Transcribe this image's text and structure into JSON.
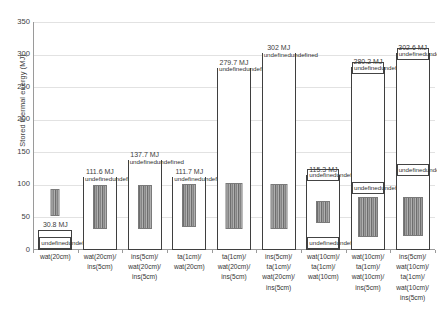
{
  "chart_data": {
    "type": "bar",
    "title": "",
    "xlabel": "",
    "ylabel": "Stored thermal energy (MJ)",
    "ylim": [
      0,
      350
    ],
    "yticks": [
      0,
      50,
      100,
      150,
      200,
      250,
      300,
      350
    ],
    "grid": true,
    "legend": "none",
    "unit": "MJ",
    "categories": [
      "wat(20cm)",
      "wat(20cm)/\nins(5cm)",
      "ins(5cm)/\nwat(20cm)/\nins(5cm)",
      "ta(1cm)/\nwat(20cm)",
      "ta(1cm)/\nwat(20cm)/\nins(5cm)",
      "ins(5cm)/\nta(1cm)/\nwat(20cm)/\nins(5cm)",
      "wat(10cm)/\nta(1cm)/\nwat(10cm)",
      "wat(10cm)/\nta(1cm)/\nwat(10cm)/\nins(5cm)",
      "ins(5cm)/\nwat(10cm)/\nta(1cm)/\nwat(10cm)/\nins(5cm)"
    ],
    "values": [
      30.8,
      111.6,
      137.7,
      111.7,
      279.7,
      302.0,
      115.3,
      280.2,
      302.6
    ],
    "value_labels": [
      "30.8 MJ",
      "111.6 MJ",
      "137.7 MJ",
      "111.7 MJ",
      "279.7 MJ",
      "302 MJ",
      "115.3 MJ",
      "280.2 MJ",
      "302.6 MJ"
    ],
    "annotations": [
      {
        "bar": 1,
        "zones": [
          {
            "name": "",
            "tw": "Tᵥᵥ=29.6 °C",
            "dt": "ΔT=3.1 °C"
          }
        ]
      },
      {
        "bar": 2,
        "zones": [
          {
            "name": "",
            "tw": "Tᵥᵥ=37.7 °C",
            "dt": "ΔT=11.2 °C"
          }
        ]
      },
      {
        "bar": 3,
        "zones": [
          {
            "name": "",
            "tw": "Tᵥᵥ=40.3 °C",
            "dt": "ΔT=13.8 °C"
          }
        ]
      },
      {
        "bar": 4,
        "zones": [
          {
            "name": "",
            "tw": "Tᵥᵥ=37.7 °C",
            "dt": "ΔT=11.2 °C"
          }
        ]
      },
      {
        "bar": 5,
        "zones": [
          {
            "name": "",
            "tw": "Tᵥᵥ=54.6 °C",
            "dt": "ΔT=28.1 °C"
          }
        ]
      },
      {
        "bar": 6,
        "zones": [
          {
            "name": "",
            "tw": "Tᵥᵥ=56.8 °C",
            "dt": "ΔT=30.3 °C"
          }
        ]
      },
      {
        "bar": 7,
        "zones": [
          {
            "name": "Outer",
            "tw": "Tᵥᵥ=43.3 °C",
            "dt": "ΔT=16.7 °C"
          },
          {
            "name": "Inner",
            "tw": "Tᵥᵥ=32.9 °C",
            "dt": "ΔT=6.4 °C"
          }
        ]
      },
      {
        "bar": 8,
        "zones": [
          {
            "name": "Outer",
            "tw": "Tᵥᵥ=55.4 °C",
            "dt": "ΔT=28.8 °C"
          },
          {
            "name": "Inner",
            "tw": "Tᵥᵥ=53.9 °C",
            "dt": "ΔT=27.4 °C"
          }
        ]
      },
      {
        "bar": 9,
        "zones": [
          {
            "name": "Outer",
            "tw": "Tᵥᵥ=57.7 °C",
            "dt": "ΔT=31.2 °C"
          },
          {
            "name": "Inner",
            "tw": "Tᵥᵥ=56.1 °C",
            "dt": "ΔT=29.6 °C"
          }
        ]
      }
    ]
  },
  "axis": {
    "ylabel": "Stored thermal energy (MJ)",
    "ytick_labels": [
      "0",
      "50",
      "100",
      "150",
      "200",
      "250",
      "300",
      "350"
    ]
  },
  "bars": [
    {
      "value_label": "30.8 MJ",
      "zone_a_name": "",
      "zone_a_tw": "T",
      "zone_a_twsub": "w",
      "zone_a_tweq": "=29.6 °C",
      "zone_a_dt": "ΔT=3.1 °C",
      "zone_b_name": "",
      "zone_b_tw": "",
      "zone_b_twsub": "",
      "zone_b_tweq": "",
      "zone_b_dt": ""
    },
    {
      "value_label": "111.6 MJ",
      "zone_a_name": "",
      "zone_a_tw": "T",
      "zone_a_twsub": "w",
      "zone_a_tweq": "=37.7 °C",
      "zone_a_dt": "ΔT=11.2 °C",
      "zone_b_name": "",
      "zone_b_tw": "",
      "zone_b_twsub": "",
      "zone_b_tweq": "",
      "zone_b_dt": ""
    },
    {
      "value_label": "137.7 MJ",
      "zone_a_name": "",
      "zone_a_tw": "T",
      "zone_a_twsub": "w",
      "zone_a_tweq": "=40.3 °C",
      "zone_a_dt": "ΔT=13.8 °C",
      "zone_b_name": "",
      "zone_b_tw": "",
      "zone_b_twsub": "",
      "zone_b_tweq": "",
      "zone_b_dt": ""
    },
    {
      "value_label": "111.7 MJ",
      "zone_a_name": "",
      "zone_a_tw": "T",
      "zone_a_twsub": "w",
      "zone_a_tweq": "=37.7 °C",
      "zone_a_dt": "ΔT=11.2 °C",
      "zone_b_name": "",
      "zone_b_tw": "",
      "zone_b_twsub": "",
      "zone_b_tweq": "",
      "zone_b_dt": ""
    },
    {
      "value_label": "279.7 MJ",
      "zone_a_name": "",
      "zone_a_tw": "T",
      "zone_a_twsub": "w",
      "zone_a_tweq": "=54.6 °C",
      "zone_a_dt": "ΔT=28.1 °C",
      "zone_b_name": "",
      "zone_b_tw": "",
      "zone_b_twsub": "",
      "zone_b_tweq": "",
      "zone_b_dt": ""
    },
    {
      "value_label": "302 MJ",
      "zone_a_name": "",
      "zone_a_tw": "T",
      "zone_a_twsub": "w",
      "zone_a_tweq": "=56.8 °C",
      "zone_a_dt": "ΔT=30.3 °C",
      "zone_b_name": "",
      "zone_b_tw": "",
      "zone_b_twsub": "",
      "zone_b_tweq": "",
      "zone_b_dt": ""
    },
    {
      "value_label": "115.3 MJ",
      "zone_a_name": "Outer",
      "zone_a_tw": "T",
      "zone_a_twsub": "w",
      "zone_a_tweq": "=43.3 °C",
      "zone_a_dt": "ΔT=16.7 °C",
      "zone_b_name": "Inner",
      "zone_b_tw": "T",
      "zone_b_twsub": "w",
      "zone_b_tweq": "=32.9 °C",
      "zone_b_dt": "ΔT=6.4 °C"
    },
    {
      "value_label": "280.2 MJ",
      "zone_a_name": "Outer",
      "zone_a_tw": "T",
      "zone_a_twsub": "w",
      "zone_a_tweq": "=55.4 °C",
      "zone_a_dt": "ΔT=28.8 °C",
      "zone_b_name": "Inner",
      "zone_b_tw": "T",
      "zone_b_twsub": "w",
      "zone_b_tweq": "=53.9 °C",
      "zone_b_dt": "ΔT=27.4 °C"
    },
    {
      "value_label": "302.6 MJ",
      "zone_a_name": "Outer",
      "zone_a_tw": "T",
      "zone_a_twsub": "w",
      "zone_a_tweq": "=57.7 °C",
      "zone_a_dt": "ΔT=31.2 °C",
      "zone_b_name": "Inner",
      "zone_b_tw": "T",
      "zone_b_twsub": "w",
      "zone_b_tweq": "=56.1 °C",
      "zone_b_dt": "ΔT=29.6 °C"
    }
  ],
  "xcats": [
    {
      "l1": "wat(20cm)",
      "l2": "",
      "l3": "",
      "l4": "",
      "l5": ""
    },
    {
      "l1": "wat(20cm)/",
      "l2": "ins(5cm)",
      "l3": "",
      "l4": "",
      "l5": ""
    },
    {
      "l1": "ins(5cm)/",
      "l2": "wat(20cm)/",
      "l3": "ins(5cm)",
      "l4": "",
      "l5": ""
    },
    {
      "l1": "ta(1cm)/",
      "l2": "wat(20cm)",
      "l3": "",
      "l4": "",
      "l5": ""
    },
    {
      "l1": "ta(1cm)/",
      "l2": "wat(20cm)/",
      "l3": "ins(5cm)",
      "l4": "",
      "l5": ""
    },
    {
      "l1": "ins(5cm)/",
      "l2": "ta(1cm)/",
      "l3": "wat(20cm)/",
      "l4": "ins(5cm)",
      "l5": ""
    },
    {
      "l1": "wat(10cm)/",
      "l2": "ta(1cm)/",
      "l3": "wat(10cm)",
      "l4": "",
      "l5": ""
    },
    {
      "l1": "wat(10cm)/",
      "l2": "ta(1cm)/",
      "l3": "wat(10cm)/",
      "l4": "ins(5cm)",
      "l5": ""
    },
    {
      "l1": "ins(5cm)/",
      "l2": "wat(10cm)/",
      "l3": "ta(1cm)/",
      "l4": "wat(10cm)/",
      "l5": "ins(5cm)"
    }
  ]
}
